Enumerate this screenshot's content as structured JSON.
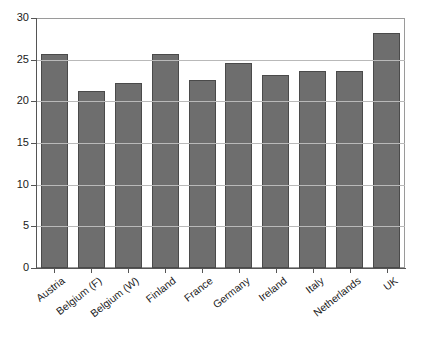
{
  "chart_data": {
    "type": "bar",
    "title": "",
    "subtitle": "",
    "xlabel": "",
    "ylabel": "",
    "categories": [
      "Austria",
      "Belgium (F)",
      "Belgium (W)",
      "Finland",
      "France",
      "Germany",
      "Ireland",
      "Italy",
      "Netherlands",
      "UK"
    ],
    "values": [
      25.7,
      21.2,
      22.2,
      25.7,
      22.6,
      24.6,
      23.2,
      23.7,
      23.7,
      28.2
    ],
    "ylim": [
      0,
      30
    ],
    "ytick_labels": [
      "0",
      "5",
      "10",
      "15",
      "20",
      "25",
      "30"
    ],
    "ytick_values": [
      0,
      5,
      10,
      15,
      20,
      25,
      30
    ],
    "grid": true,
    "grid_axis": "y",
    "legend": false,
    "legend_position": "none",
    "bar_color": "#6e6e6e",
    "bar_edge_color": "#4a4a4a",
    "axis_color": "#555555",
    "grid_color": "#8d8d8d",
    "background_color": "#ffffff",
    "xlabel_rotation": -38
  }
}
